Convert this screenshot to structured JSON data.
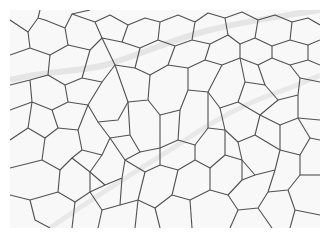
{
  "image": {
    "subject": "microscopy cross-section of polygonal cells",
    "colors": {
      "background": "#ffffff",
      "field": "#f7f7f7",
      "membrane": "#3a3a3a",
      "septum": "#e2e2e2"
    }
  }
}
